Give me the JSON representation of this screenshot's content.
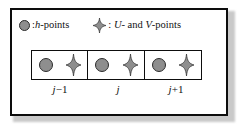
{
  "figure": {
    "legend": {
      "items": [
        {
          "icon": "gray-circle-marker",
          "icon_color": "#8e8e8e",
          "icon_stroke": "#2b2b2b",
          "text_prefix": ":",
          "symbol": "h",
          "text_suffix": "-points",
          "full_text": ": h-points"
        },
        {
          "icon": "gray-four-point-star-marker",
          "icon_color": "#8e8e8e",
          "icon_stroke": "#2b2b2b",
          "text_prefix": ":",
          "symbol_1": "U",
          "conjunction": "- and",
          "symbol_2": "V",
          "text_suffix": "-points",
          "full_text": ": U- and V-points"
        }
      ]
    },
    "grid": {
      "cells": [
        {
          "index_label_symbol": "j",
          "index_label_operator": "−",
          "index_label_number": "1",
          "index_label": "j − 1",
          "markers": [
            "h-point-circle",
            "uv-point-star"
          ]
        },
        {
          "index_label_symbol": "j",
          "index_label_operator": "",
          "index_label_number": "",
          "index_label": "j",
          "markers": [
            "h-point-circle",
            "uv-point-star"
          ]
        },
        {
          "index_label_symbol": "j",
          "index_label_operator": "+",
          "index_label_number": "1",
          "index_label": "j + 1",
          "markers": [
            "h-point-circle",
            "uv-point-star"
          ]
        }
      ]
    },
    "colors": {
      "marker_fill": "#8e8e8e",
      "marker_stroke": "#2b2b2b",
      "frame_border": "#0d0d0d",
      "background": "#ffffff",
      "text": "#111111"
    }
  }
}
